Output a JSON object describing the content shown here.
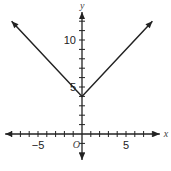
{
  "chart_data": {
    "type": "line",
    "title": "",
    "function": "y = |x| + 4",
    "xlabel": "x",
    "ylabel": "y",
    "origin_label": "O",
    "xlim": [
      -8.5,
      8.5
    ],
    "ylim": [
      -3.5,
      14
    ],
    "x_ticks": [
      -8,
      -7,
      -6,
      -5,
      -4,
      -3,
      -2,
      -1,
      1,
      2,
      3,
      4,
      5,
      6,
      7,
      8
    ],
    "y_ticks": [
      -2,
      -1,
      1,
      2,
      3,
      4,
      5,
      6,
      7,
      8,
      9,
      10,
      11,
      12
    ],
    "x_tick_labels": [
      {
        "value": -5,
        "text": "−5"
      },
      {
        "value": 5,
        "text": "5"
      }
    ],
    "y_tick_labels": [
      {
        "value": 5,
        "text": "5"
      },
      {
        "value": 10,
        "text": "10"
      }
    ],
    "series": [
      {
        "name": "y=|x|+4",
        "points": [
          [
            -8,
            12
          ],
          [
            0,
            4
          ],
          [
            8,
            12
          ]
        ],
        "arrows": true
      }
    ],
    "grid": false,
    "color": "#222222"
  }
}
